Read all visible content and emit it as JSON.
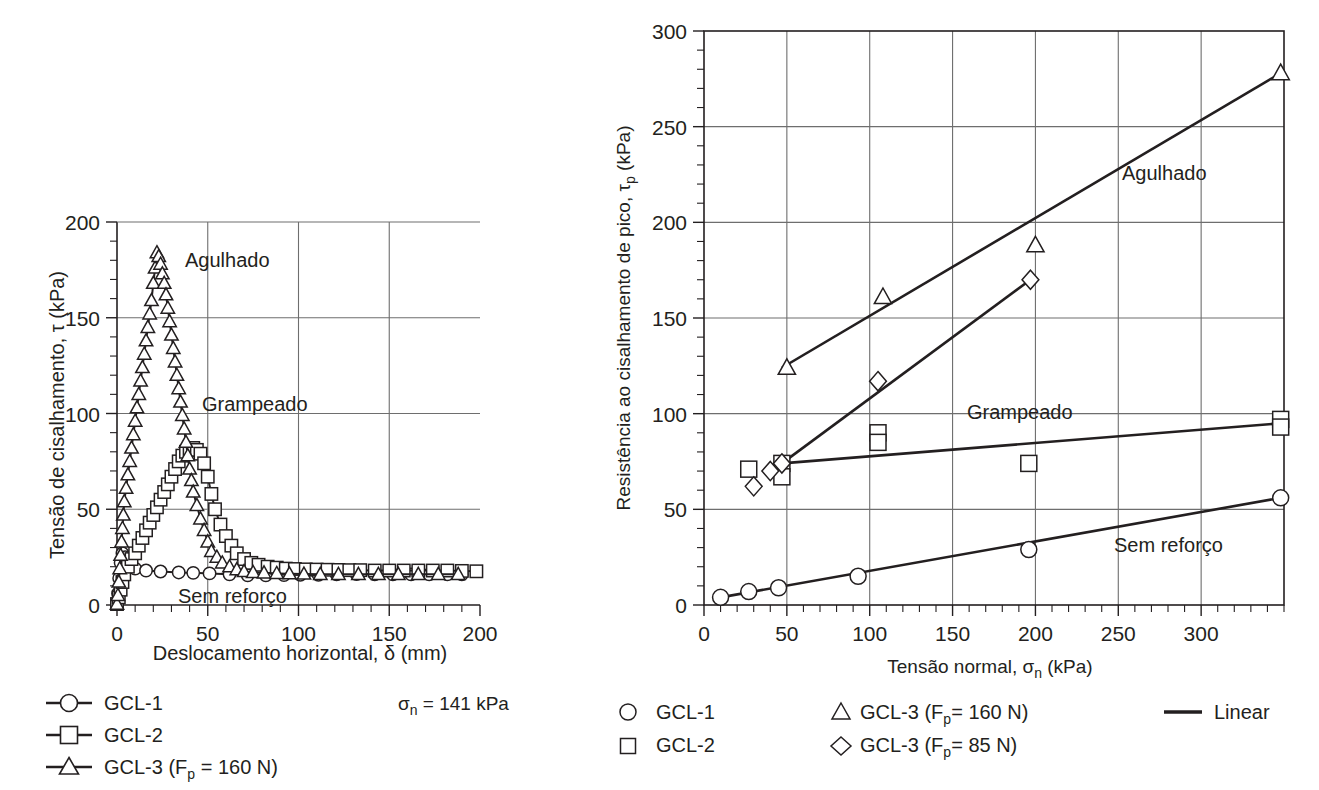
{
  "figure": {
    "background": "#ffffff",
    "ink_color": "#231f20",
    "grid_color": "#6e6e6e"
  },
  "chart_data": [
    {
      "id": "left",
      "type": "line",
      "title": "",
      "xlabel": "Deslocamento horizontal, δ (mm)",
      "ylabel": "Tensão de cisalhamento, τ (kPa)",
      "xlim": [
        0,
        200
      ],
      "ylim": [
        0,
        200
      ],
      "xticks": [
        0,
        50,
        100,
        150,
        200
      ],
      "xticklabels": [
        "0",
        "50",
        "100",
        "150",
        "200"
      ],
      "yticks": [
        0,
        50,
        100,
        150,
        200
      ],
      "yticklabels": [
        "0",
        "50",
        "100",
        "150",
        "200"
      ],
      "x_minor_step": 10,
      "y_minor_step": 10,
      "grid": true,
      "grid_x_at": [
        50,
        100,
        150
      ],
      "grid_y_at": [
        50,
        100,
        150
      ],
      "annotations": [
        {
          "text": "Agulhado",
          "x": 42,
          "y": 178
        },
        {
          "text": "Grampeado",
          "x": 52,
          "y": 101
        },
        {
          "text": "Sem reforço",
          "x": 45,
          "y": 10
        },
        {
          "text": "σn = 141 kPa",
          "x": null,
          "y": null,
          "placement": "legend-right"
        }
      ],
      "condition_note": {
        "prefix": "σ",
        "sub": "n",
        "value": " = 141 kPa"
      },
      "series": [
        {
          "name": "GCL-1",
          "label": "GCL-1",
          "marker": "circle",
          "points": [
            [
              0,
              0.5
            ],
            [
              0.6,
              6
            ],
            [
              1.2,
              14
            ],
            [
              2.0,
              22
            ],
            [
              3.0,
              27
            ],
            [
              4.5,
              25
            ],
            [
              7,
              21
            ],
            [
              10,
              19
            ],
            [
              16,
              18
            ],
            [
              24,
              17.5
            ],
            [
              34,
              17
            ],
            [
              42,
              16.8
            ],
            [
              51,
              16.5
            ],
            [
              62,
              16
            ],
            [
              72,
              15.5
            ],
            [
              82,
              15.5
            ],
            [
              92,
              15.6
            ],
            [
              101,
              15.8
            ],
            [
              111,
              15.8
            ],
            [
              121,
              16
            ],
            [
              132,
              16.2
            ],
            [
              142,
              16
            ],
            [
              152,
              16
            ],
            [
              162,
              16
            ],
            [
              172,
              16
            ],
            [
              182,
              16
            ],
            [
              190,
              16
            ]
          ]
        },
        {
          "name": "GCL-2",
          "label": "GCL-2",
          "marker": "square",
          "points": [
            [
              0,
              0.5
            ],
            [
              1,
              4
            ],
            [
              2,
              8
            ],
            [
              3,
              12
            ],
            [
              4,
              16
            ],
            [
              6,
              20
            ],
            [
              8,
              24
            ],
            [
              10,
              27
            ],
            [
              12,
              31
            ],
            [
              14,
              35
            ],
            [
              16,
              39
            ],
            [
              18,
              43
            ],
            [
              20,
              47
            ],
            [
              22,
              51
            ],
            [
              24,
              55
            ],
            [
              26,
              59
            ],
            [
              28,
              63
            ],
            [
              30,
              67
            ],
            [
              32,
              71
            ],
            [
              34,
              75
            ],
            [
              36,
              78
            ],
            [
              38,
              80
            ],
            [
              40,
              81
            ],
            [
              42,
              82
            ],
            [
              44,
              81
            ],
            [
              46,
              79
            ],
            [
              48,
              74
            ],
            [
              50,
              67
            ],
            [
              52,
              58
            ],
            [
              54,
              50
            ],
            [
              57,
              42
            ],
            [
              60,
              36
            ],
            [
              63,
              31
            ],
            [
              66,
              27
            ],
            [
              70,
              24
            ],
            [
              74,
              22
            ],
            [
              78,
              21
            ],
            [
              83,
              20
            ],
            [
              88,
              19.5
            ],
            [
              93,
              19
            ],
            [
              98,
              18.8
            ],
            [
              104,
              18.6
            ],
            [
              110,
              18.5
            ],
            [
              116,
              18.4
            ],
            [
              122,
              18.3
            ],
            [
              128,
              18.2
            ],
            [
              134,
              18.2
            ],
            [
              142,
              18
            ],
            [
              150,
              18
            ],
            [
              158,
              18
            ],
            [
              166,
              18
            ],
            [
              174,
              18
            ],
            [
              182,
              18
            ],
            [
              190,
              17.8
            ],
            [
              198,
              17.6
            ]
          ]
        },
        {
          "name": "GCL-3 (Fp = 160 N)",
          "label": "GCL-3 (Fₚ = 160 N)",
          "label_parts": {
            "pre": "GCL-3 (F",
            "sub": "p",
            "post": " = 160 N)"
          },
          "marker": "triangle",
          "points": [
            [
              0,
              0.5
            ],
            [
              0.5,
              5
            ],
            [
              1,
              12
            ],
            [
              1.5,
              19
            ],
            [
              2,
              26
            ],
            [
              2.5,
              33
            ],
            [
              3,
              40
            ],
            [
              3.5,
              47
            ],
            [
              4,
              54
            ],
            [
              5,
              61
            ],
            [
              6,
              68
            ],
            [
              7,
              75
            ],
            [
              8,
              82
            ],
            [
              9,
              89
            ],
            [
              10,
              96
            ],
            [
              11,
              103
            ],
            [
              12,
              110
            ],
            [
              13,
              117
            ],
            [
              14,
              124
            ],
            [
              15,
              131
            ],
            [
              16,
              138
            ],
            [
              17,
              145
            ],
            [
              18,
              152
            ],
            [
              19,
              159
            ],
            [
              20,
              168
            ],
            [
              21,
              176
            ],
            [
              22,
              184
            ],
            [
              23,
              182
            ],
            [
              24,
              178
            ],
            [
              25,
              173
            ],
            [
              26,
              168
            ],
            [
              27,
              162
            ],
            [
              28,
              155
            ],
            [
              29,
              148
            ],
            [
              30,
              141
            ],
            [
              31,
              134
            ],
            [
              32,
              127
            ],
            [
              33,
              120
            ],
            [
              34,
              113
            ],
            [
              35,
              106
            ],
            [
              36,
              99
            ],
            [
              37,
              92
            ],
            [
              38,
              85
            ],
            [
              39,
              78
            ],
            [
              40,
              71
            ],
            [
              41,
              65
            ],
            [
              42,
              59
            ],
            [
              44,
              52
            ],
            [
              46,
              45
            ],
            [
              48,
              39
            ],
            [
              50,
              33
            ],
            [
              52,
              28
            ],
            [
              55,
              25
            ],
            [
              58,
              22
            ],
            [
              62,
              20
            ],
            [
              66,
              18.5
            ],
            [
              70,
              17.5
            ],
            [
              75,
              17
            ],
            [
              81,
              16.8
            ],
            [
              88,
              16.5
            ],
            [
              95,
              16.3
            ],
            [
              103,
              16.2
            ],
            [
              112,
              16
            ],
            [
              122,
              16
            ],
            [
              133,
              16
            ],
            [
              144,
              16
            ],
            [
              155,
              16
            ],
            [
              166,
              16
            ],
            [
              177,
              16
            ],
            [
              188,
              16
            ]
          ]
        }
      ],
      "legend": {
        "position": "below-left",
        "entries": [
          {
            "marker": "circle",
            "label": "GCL-1",
            "with_line": true
          },
          {
            "marker": "square",
            "label": "GCL-2",
            "with_line": true
          },
          {
            "marker": "triangle",
            "label": "GCL-3 (Fp = 160 N)",
            "with_line": true,
            "parts": {
              "pre": "GCL-3 (F",
              "sub": "p",
              "post": " = 160 N)"
            }
          }
        ]
      }
    },
    {
      "id": "right",
      "type": "scatter",
      "title": "",
      "xlabel": "Tensão normal, σn (kPa)",
      "xlabel_parts": {
        "pre": "Tensão normal, σ",
        "sub": "n",
        "post": " (kPa)"
      },
      "ylabel": "Resistência ao cisalhamento de pico, τp (kPa)",
      "ylabel_parts": {
        "pre": "Resistência ao cisalhamento de pico, τ",
        "sub": "p",
        "post": " (kPa)"
      },
      "xlim": [
        0,
        350
      ],
      "ylim": [
        0,
        300
      ],
      "xticks": [
        0,
        50,
        100,
        150,
        200,
        250,
        300
      ],
      "xticklabels": [
        "0",
        "50",
        "100",
        "150",
        "200",
        "250",
        "300"
      ],
      "yticks": [
        0,
        50,
        100,
        150,
        200,
        250,
        300
      ],
      "yticklabels": [
        "0",
        "50",
        "100",
        "150",
        "200",
        "250",
        "300"
      ],
      "x_minor_step": 10,
      "y_minor_step": 10,
      "grid": true,
      "grid_x_at": [
        50,
        100,
        150,
        200,
        250,
        300
      ],
      "grid_y_at": [
        50,
        100,
        150,
        200,
        250
      ],
      "annotations": [
        {
          "text": "Agulhado",
          "x": 272,
          "y": 228
        },
        {
          "text": "Grampeado",
          "x": 190,
          "y": 102
        },
        {
          "text": "Sem reforço",
          "x": 265,
          "y": 35
        }
      ],
      "series": [
        {
          "name": "GCL-1",
          "label": "GCL-1",
          "marker": "circle",
          "points": [
            [
              10,
              4
            ],
            [
              27,
              7
            ],
            [
              45,
              9
            ],
            [
              93,
              15
            ],
            [
              196,
              29
            ],
            [
              348,
              56
            ]
          ]
        },
        {
          "name": "GCL-2",
          "label": "GCL-2",
          "marker": "square",
          "points": [
            [
              27,
              71
            ],
            [
              47,
              74
            ],
            [
              47,
              67
            ],
            [
              105,
              90
            ],
            [
              105,
              85
            ],
            [
              196,
              74
            ],
            [
              348,
              97
            ],
            [
              348,
              93
            ]
          ]
        },
        {
          "name": "GCL-3 (Fp = 160 N)",
          "label": "GCL-3 (Fp= 160 N)",
          "label_parts": {
            "pre": "GCL-3 (F",
            "sub": "p",
            "post": "= 160 N)"
          },
          "marker": "triangle",
          "points": [
            [
              50,
              124
            ],
            [
              108,
              161
            ],
            [
              200,
              188
            ],
            [
              348,
              278
            ]
          ]
        },
        {
          "name": "GCL-3 (Fp = 85 N)",
          "label": "GCL-3 (Fp= 85 N)",
          "label_parts": {
            "pre": "GCL-3 (F",
            "sub": "p",
            "post": "= 85 N)"
          },
          "marker": "diamond",
          "points": [
            [
              30,
              62
            ],
            [
              40,
              70
            ],
            [
              47,
              74
            ],
            [
              105,
              117
            ],
            [
              197,
              170
            ]
          ]
        }
      ],
      "fit_lines": [
        {
          "name": "Agulhado-fit",
          "from": [
            47,
            124
          ],
          "to": [
            348,
            278
          ]
        },
        {
          "name": "GCL3-85-fit",
          "from": [
            47,
            74
          ],
          "to": [
            197,
            170
          ]
        },
        {
          "name": "Grampeado-fit",
          "from": [
            47,
            74
          ],
          "to": [
            348,
            95
          ]
        },
        {
          "name": "Sem-reforco-fit",
          "from": [
            10,
            4
          ],
          "to": [
            348,
            56
          ]
        }
      ],
      "legend": {
        "position": "below",
        "columns": [
          [
            {
              "marker": "circle",
              "label": "GCL-1"
            },
            {
              "marker": "square",
              "label": "GCL-2"
            }
          ],
          [
            {
              "marker": "triangle",
              "label": "GCL-3 (Fp= 160 N)",
              "parts": {
                "pre": "GCL-3 (F",
                "sub": "p",
                "post": "= 160 N)"
              }
            },
            {
              "marker": "diamond",
              "label": "GCL-3 (Fp= 85 N)",
              "parts": {
                "pre": "GCL-3 (F",
                "sub": "p",
                "post": "= 85 N)"
              }
            }
          ],
          [
            {
              "marker": "line",
              "label": "Linear"
            }
          ]
        ]
      }
    }
  ],
  "left_panel": {
    "xlabel": "Deslocamento horizontal, δ (mm)",
    "ylabel": "Tensão de cisalhamento, τ (kPa)",
    "label_agulhado": "Agulhado",
    "label_grampeado": "Grampeado",
    "label_sem_reforco": "Sem reforço",
    "legend_gcl1": "GCL-1",
    "legend_gcl2": "GCL-2",
    "legend_gcl3_pre": "GCL-3 (F",
    "legend_gcl3_sub": "p",
    "legend_gcl3_post": " = 160 N)",
    "note_sigma": "σ",
    "note_sub": "n",
    "note_value": " = 141 kPa"
  },
  "right_panel": {
    "xlabel_pre": "Tensão normal, σ",
    "xlabel_sub": "n",
    "xlabel_post": " (kPa)",
    "ylabel_pre": "Resistência ao cisalhamento de pico, τ",
    "ylabel_sub": "p",
    "ylabel_post": " (kPa)",
    "label_agulhado": "Agulhado",
    "label_grampeado": "Grampeado",
    "label_sem_reforco": "Sem reforço",
    "legend_gcl1": "GCL-1",
    "legend_gcl2": "GCL-2",
    "legend_gcl3_160_pre": "GCL-3 (F",
    "legend_gcl3_160_sub": "p",
    "legend_gcl3_160_post": "= 160 N)",
    "legend_gcl3_85_pre": "GCL-3 (F",
    "legend_gcl3_85_sub": "p",
    "legend_gcl3_85_post": "= 85 N)",
    "legend_linear": "Linear"
  }
}
